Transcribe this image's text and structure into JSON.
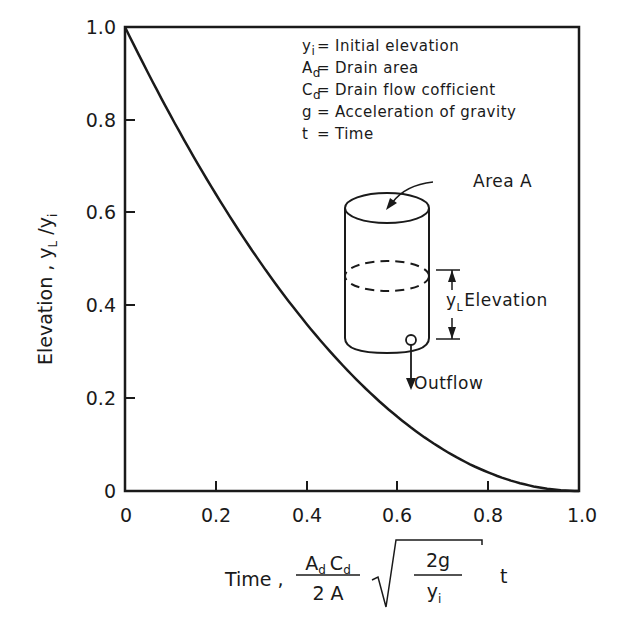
{
  "chart_data": {
    "type": "line",
    "title": "",
    "xlabel": "Time, (A_d C_d / 2A) √(2g / y_i) t",
    "ylabel": "Elevation, y_L / y_i",
    "xlim": [
      0,
      1.0
    ],
    "ylim": [
      0,
      1.0
    ],
    "grid": false,
    "x_ticks": [
      "0",
      "0.2",
      "0.4",
      "0.6",
      "0.8",
      "1.0"
    ],
    "y_ticks": [
      "0",
      "0.2",
      "0.4",
      "0.6",
      "0.8",
      "1.0"
    ],
    "series": [
      {
        "name": "Elevation ratio",
        "x": [
          0,
          0.1,
          0.2,
          0.3,
          0.4,
          0.5,
          0.6,
          0.7,
          0.8,
          0.9,
          1.0
        ],
        "values": [
          1.0,
          0.81,
          0.64,
          0.49,
          0.36,
          0.25,
          0.16,
          0.09,
          0.04,
          0.01,
          0.0
        ]
      }
    ],
    "legend": [
      {
        "symbol": "y",
        "sub": "i",
        "desc": "Initial elevation"
      },
      {
        "symbol": "A",
        "sub": "d",
        "desc": "Drain area"
      },
      {
        "symbol": "C",
        "sub": "d",
        "desc": "Drain flow cofficient"
      },
      {
        "symbol": "g",
        "sub": "",
        "desc": "Acceleration of gravity"
      },
      {
        "symbol": "t",
        "sub": "",
        "desc": "Time"
      }
    ],
    "annotations": [
      "Area A",
      "y_L Elevation",
      "Outflow"
    ]
  },
  "labels": {
    "x_time": "Time ,",
    "x_num_A": "A",
    "x_num_Ad_sub": "d",
    "x_num_C": "C",
    "x_num_Cd_sub": "d",
    "x_den": "2 A",
    "x_sqrt_num": "2g",
    "x_sqrt_den": "y",
    "x_sqrt_den_sub": "i",
    "x_t": "t",
    "y_main": "Elevation ,  y",
    "y_sub_L": "L",
    "y_slash": " /y",
    "y_sub_i": "i",
    "eq": "=",
    "area": "Area A",
    "elev_y": "y",
    "elev_sub": "L",
    "elev_text": "Elevation",
    "outflow": "Outflow"
  }
}
